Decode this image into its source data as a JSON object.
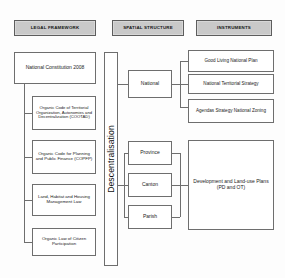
{
  "diagram": {
    "columns": [
      {
        "id": "legal-framework",
        "label": "LEGAL FRAMEWORK"
      },
      {
        "id": "spatial-structure",
        "label": "SPATIAL STRUCTURE"
      },
      {
        "id": "instruments",
        "label": "INSTRUMENTS"
      }
    ],
    "legal_framework": {
      "root": {
        "id": "national-constitution",
        "label": "National Constitution 2008"
      },
      "laws": [
        {
          "id": "cootad",
          "label": "Organic Code of Territorial Organization, Autonomies and Decentralization (COOTAD)"
        },
        {
          "id": "copfp",
          "label": "Organic Code for Planning and Public Finance (COPFP)"
        },
        {
          "id": "land-habitat-housing-law",
          "label": "Land, Habitat and Housing Management Law"
        },
        {
          "id": "citizen-participation-law",
          "label": "Organic Law of Citizen Participation"
        }
      ]
    },
    "spine": {
      "id": "descentralisation",
      "label": "Descentralisation"
    },
    "spatial_structure": {
      "levels": [
        {
          "id": "national",
          "label": "National"
        },
        {
          "id": "province",
          "label": "Province"
        },
        {
          "id": "canton",
          "label": "Canton"
        },
        {
          "id": "parish",
          "label": "Parish"
        }
      ]
    },
    "instruments": {
      "national": [
        {
          "id": "good-living-national-plan",
          "label": "Good Living National Plan"
        },
        {
          "id": "national-territorial-strategy",
          "label": "National Territorial Strategy"
        },
        {
          "id": "agendas-strategy-national-zoning",
          "label": "Agendas Strategy National Zoning"
        }
      ],
      "subnational": [
        {
          "id": "development-land-use-plans",
          "label": "Development and Land-use Plans (PD and OT)"
        }
      ]
    },
    "colors": {
      "header_fill": "#c9c9c9",
      "box_fill": "#ffffff",
      "line": "#6e6e6e",
      "text": "#1b1b1b",
      "background": "#fdfdfd"
    }
  }
}
